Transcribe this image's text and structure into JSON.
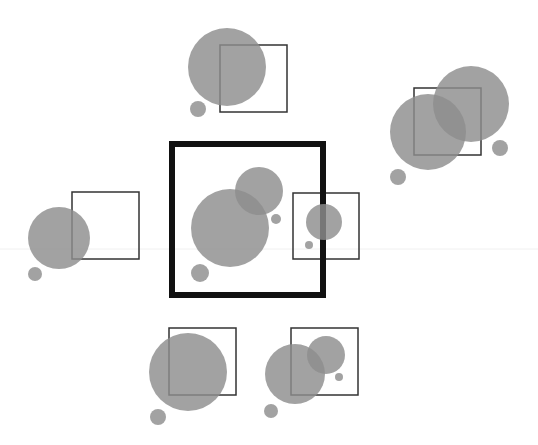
{
  "diagram": {
    "background": "#ffffff",
    "circle_color": "#8e8e8e",
    "square_color": "#333333",
    "main_square_color": "#111111",
    "guide_line": {
      "y": 249,
      "color": "#f0f0f0"
    },
    "main_square": {
      "x": 172,
      "y": 144,
      "size": 151,
      "stroke": 6
    },
    "groups": [
      {
        "id": "top",
        "square": {
          "x": 220,
          "y": 45,
          "size": 67
        },
        "circles": [
          {
            "cx": 227,
            "cy": 67,
            "r": 39
          },
          {
            "cx": 198,
            "cy": 109,
            "r": 8
          }
        ]
      },
      {
        "id": "top-right",
        "square": {
          "x": 414,
          "y": 88,
          "size": 67
        },
        "circles": [
          {
            "cx": 471,
            "cy": 104,
            "r": 38
          },
          {
            "cx": 428,
            "cy": 132,
            "r": 38
          },
          {
            "cx": 500,
            "cy": 148,
            "r": 8
          },
          {
            "cx": 398,
            "cy": 177,
            "r": 8
          }
        ]
      },
      {
        "id": "left",
        "square": {
          "x": 72,
          "y": 192,
          "size": 67
        },
        "circles": [
          {
            "cx": 59,
            "cy": 238,
            "r": 31
          },
          {
            "cx": 35,
            "cy": 274,
            "r": 7
          }
        ]
      },
      {
        "id": "center",
        "square": null,
        "circles": [
          {
            "cx": 230,
            "cy": 228,
            "r": 39
          },
          {
            "cx": 259,
            "cy": 191,
            "r": 24
          },
          {
            "cx": 276,
            "cy": 219,
            "r": 5
          },
          {
            "cx": 200,
            "cy": 273,
            "r": 9
          }
        ]
      },
      {
        "id": "right",
        "square": {
          "x": 293,
          "y": 193,
          "size": 66
        },
        "circles": [
          {
            "cx": 324,
            "cy": 222,
            "r": 18
          },
          {
            "cx": 309,
            "cy": 245,
            "r": 4
          }
        ]
      },
      {
        "id": "bottom-left",
        "square": {
          "x": 169,
          "y": 328,
          "size": 67
        },
        "circles": [
          {
            "cx": 188,
            "cy": 372,
            "r": 39
          },
          {
            "cx": 158,
            "cy": 417,
            "r": 8
          }
        ]
      },
      {
        "id": "bottom-right",
        "square": {
          "x": 291,
          "y": 328,
          "size": 67
        },
        "circles": [
          {
            "cx": 295,
            "cy": 374,
            "r": 30
          },
          {
            "cx": 326,
            "cy": 355,
            "r": 19
          },
          {
            "cx": 339,
            "cy": 377,
            "r": 4
          },
          {
            "cx": 271,
            "cy": 411,
            "r": 7
          }
        ]
      }
    ]
  }
}
